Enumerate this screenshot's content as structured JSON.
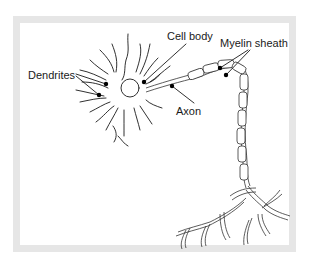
{
  "diagram": {
    "labels": {
      "dendrites": "Dendrites",
      "cell_body": "Cell body",
      "myelin_sheath": "Myelin sheath",
      "axon": "Axon"
    }
  }
}
